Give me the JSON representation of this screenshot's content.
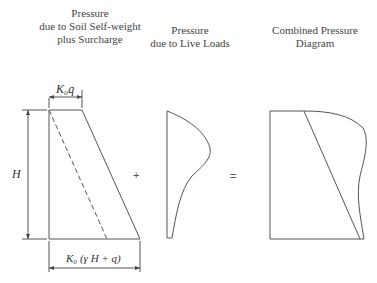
{
  "titles": {
    "soil": [
      "Pressure",
      "due to Soil Self-weight",
      "plus Surcharge"
    ],
    "live": [
      "Pressure",
      "due to Live Loads"
    ],
    "combined": [
      "Combined Pressure",
      "Diagram"
    ]
  },
  "labels": {
    "top_width": "K₀q",
    "height": "H",
    "bottom_width": "K₀ (γ H + q)",
    "plus": "+",
    "equals": "="
  },
  "colors": {
    "line": "#555555",
    "text": "#333333"
  }
}
